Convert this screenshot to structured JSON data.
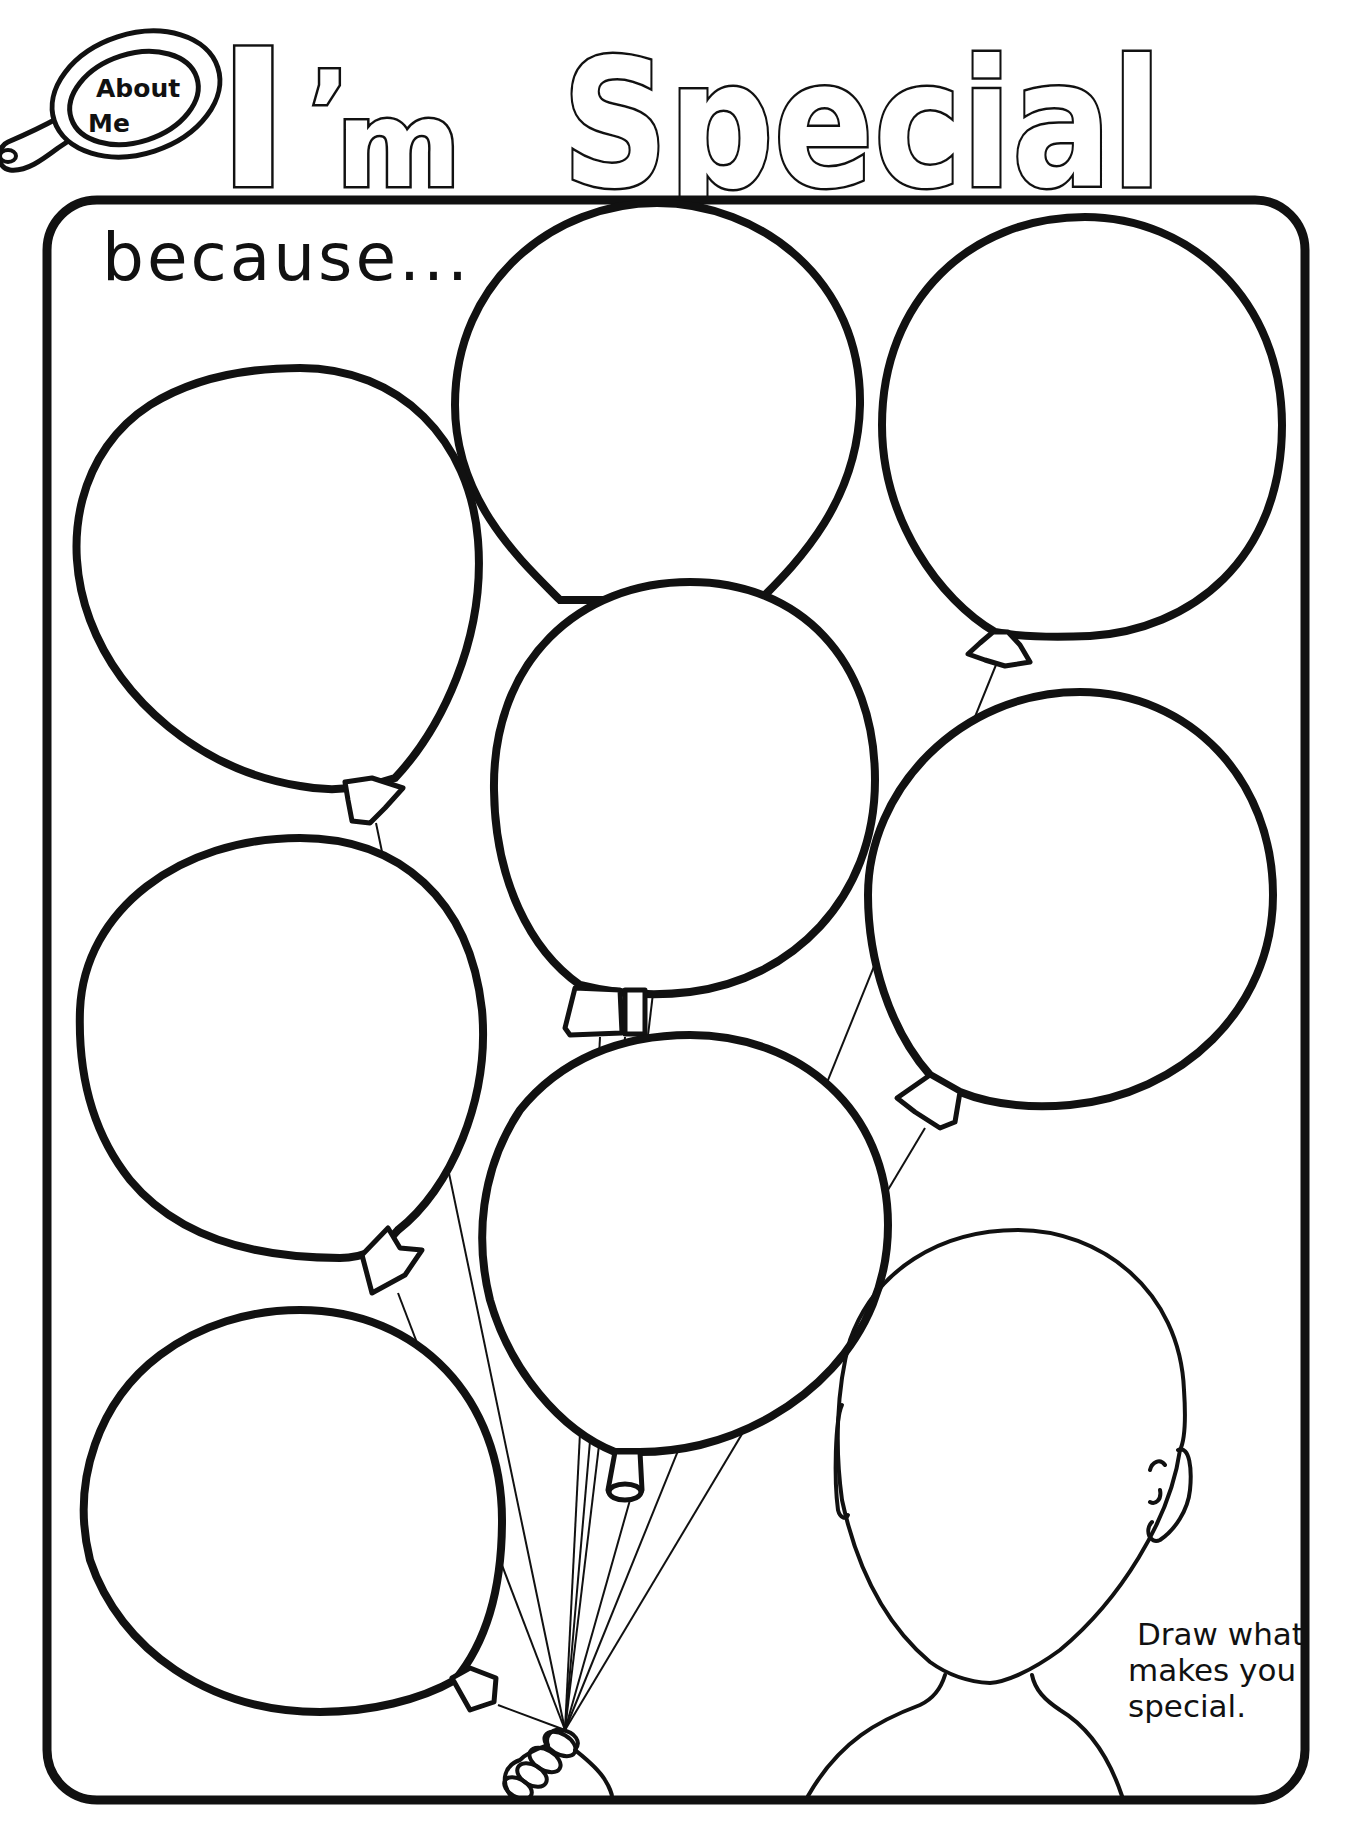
{
  "worksheet": {
    "badge": {
      "line1": "About",
      "line2": "Me",
      "icon": "hand-mirror-icon"
    },
    "title": {
      "part1": "I",
      "apostrophe": "’",
      "part2": "m",
      "part3": "Special"
    },
    "prompt": "because...",
    "instructions": {
      "line1": "Draw what",
      "line2": "makes you",
      "line3": "special."
    },
    "colors": {
      "ink": "#111111",
      "paper": "#ffffff"
    },
    "balloons": [
      {
        "id": "top-center",
        "label": ""
      },
      {
        "id": "top-right",
        "label": ""
      },
      {
        "id": "left-top",
        "label": ""
      },
      {
        "id": "center-middle",
        "label": ""
      },
      {
        "id": "right-middle",
        "label": ""
      },
      {
        "id": "left-middle",
        "label": ""
      },
      {
        "id": "center-bottom",
        "label": ""
      },
      {
        "id": "left-bottom",
        "label": ""
      }
    ],
    "drawing_area": {
      "figure": "blank-face-outline"
    }
  }
}
